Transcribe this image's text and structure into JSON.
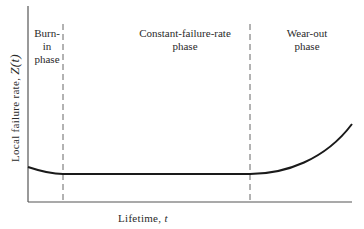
{
  "diagram": {
    "y_axis": {
      "label": "Local failure rate,",
      "variable": "Z(t)"
    },
    "x_axis": {
      "label": "Lifetime,",
      "variable": "t"
    },
    "phases": [
      {
        "line1": "Burn-in",
        "line2": "phase"
      },
      {
        "line1": "Constant-failure-rate",
        "line2": "phase"
      },
      {
        "line1": "Wear-out",
        "line2": "phase"
      }
    ],
    "colors": {
      "curve": "#1a1a1a",
      "axis": "#555555",
      "dash": "#666666"
    }
  }
}
